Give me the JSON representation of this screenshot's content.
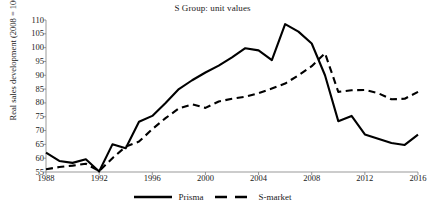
{
  "chart_data": {
    "type": "line",
    "title": "S Group: unit values",
    "xlabel": "",
    "ylabel": "Real sales development (2008 = 100)",
    "xlim": [
      1988,
      2016
    ],
    "ylim": [
      55,
      110
    ],
    "xticks": [
      1988,
      1992,
      1996,
      2000,
      2004,
      2008,
      2012,
      2016
    ],
    "yticks": [
      55,
      60,
      65,
      70,
      75,
      80,
      85,
      90,
      95,
      100,
      105,
      110
    ],
    "grid": false,
    "legend_position": "bottom",
    "x": [
      1988,
      1989,
      1990,
      1991,
      1992,
      1993,
      1994,
      1995,
      1996,
      1997,
      1998,
      1999,
      2000,
      2001,
      2002,
      2003,
      2004,
      2005,
      2006,
      2007,
      2008,
      2009,
      2010,
      2011,
      2012,
      2013,
      2014,
      2015,
      2016
    ],
    "series": [
      {
        "name": "Prisma",
        "style": "solid",
        "color": "#000000",
        "values": [
          62.0,
          59.0,
          58.3,
          59.6,
          55.2,
          65.0,
          63.6,
          73.2,
          75.3,
          80.0,
          85.0,
          88.2,
          91.0,
          93.5,
          96.5,
          99.8,
          99.0,
          95.5,
          108.5,
          105.8,
          101.5,
          90.0,
          73.4,
          75.3,
          68.6,
          67.0,
          65.5,
          64.8,
          68.5
        ]
      },
      {
        "name": "S-market",
        "style": "dashed",
        "color": "#000000",
        "values": [
          56.0,
          56.8,
          57.3,
          58.0,
          55.3,
          60.0,
          64.2,
          66.0,
          70.5,
          74.5,
          78.0,
          79.5,
          78.2,
          80.5,
          81.5,
          82.2,
          83.5,
          85.2,
          87.0,
          90.0,
          93.3,
          98.0,
          84.0,
          84.6,
          84.7,
          83.5,
          81.3,
          81.5,
          84.0
        ]
      }
    ]
  },
  "legend": {
    "entries": [
      {
        "label": "Prisma",
        "style": "solid"
      },
      {
        "label": "S-market",
        "style": "dashed"
      }
    ]
  }
}
